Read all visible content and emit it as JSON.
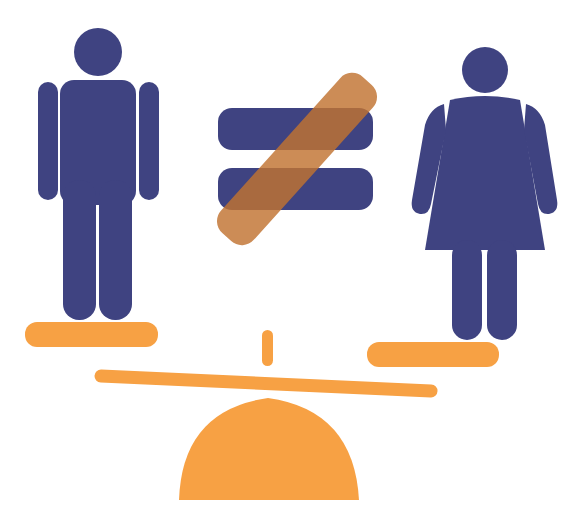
{
  "illustration": {
    "title": "",
    "colors": {
      "figure": "#3f4381",
      "orange": "#f7a144",
      "slash": "#c17331",
      "background": "#ffffff"
    },
    "elements": [
      "male-figure",
      "female-figure",
      "not-equal-sign",
      "left-platform",
      "right-platform",
      "seesaw-beam",
      "fulcrum-tick",
      "fulcrum-dome"
    ]
  }
}
